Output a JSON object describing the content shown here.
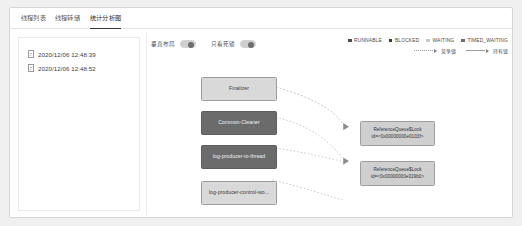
{
  "window": {
    "tabs": [
      {
        "label": "线程列表",
        "active": false
      },
      {
        "label": "线程转储",
        "active": false
      },
      {
        "label": "统计分析图",
        "active": true
      }
    ]
  },
  "sidebar": {
    "items": [
      {
        "label": "2020/12/06 12:48:39",
        "icon": "document-icon"
      },
      {
        "label": "2020/12/06 12:48:52",
        "icon": "document-icon"
      }
    ]
  },
  "toolbar": {
    "toggles": [
      {
        "label": "垂直布局",
        "state": "on"
      },
      {
        "label": "只看死锁",
        "state": "on"
      }
    ]
  },
  "legend": {
    "statuses": [
      {
        "label": "RUNNABLE",
        "color": "#4d4d4d"
      },
      {
        "label": "BLOCKED",
        "color": "#3a3a3a"
      },
      {
        "label": "WAITING",
        "color": "#c8c8c8"
      },
      {
        "label": "TIMED_WAITING",
        "color": "#6e6e6e"
      }
    ],
    "edges": [
      {
        "label": "竞争锁",
        "style": "dashed"
      },
      {
        "label": "持有锁",
        "style": "solid"
      }
    ]
  },
  "graph": {
    "threads": [
      {
        "label": "Finalizer",
        "state": "light"
      },
      {
        "label": "Common-Cleaner",
        "state": "dark"
      },
      {
        "label": "log-producer-io-thread",
        "state": "dark"
      },
      {
        "label": "log-producer-control-wo...",
        "state": "light"
      }
    ],
    "locks": [
      {
        "title": "ReferenceQueue$Lock",
        "id": "id=<0x00000000e0103f>"
      },
      {
        "title": "ReferenceQueue$Lock",
        "id": "id=<0x00000000e019b0>"
      }
    ]
  },
  "colors": {
    "accent": "#3a3a3a",
    "panel_border": "#e4e4e4",
    "node_light": "#d9d9d9",
    "node_dark": "#6b6b6b"
  }
}
